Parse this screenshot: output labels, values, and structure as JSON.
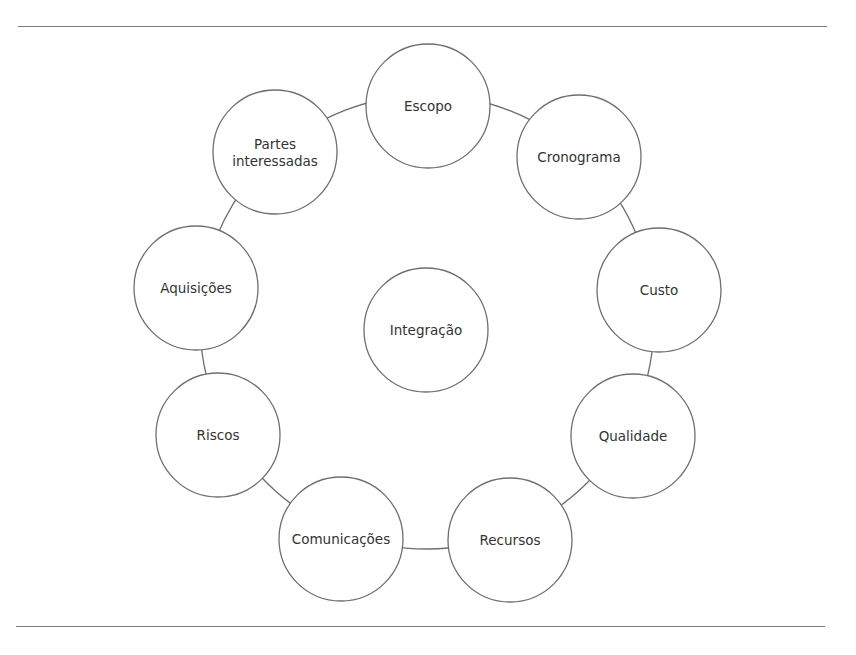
{
  "diagram": {
    "type": "ring-of-knowledge-areas",
    "colors": {
      "stroke": "#6e6e6e",
      "text": "#333333",
      "background": "#ffffff",
      "rule": "#7a7a7a"
    },
    "ring": {
      "cx": 427,
      "cy": 322,
      "r": 227
    },
    "center_node": {
      "label": "Integração",
      "cx": 426,
      "cy": 330,
      "r": 62
    },
    "outer_nodes": [
      {
        "id": "escopo",
        "label_lines": [
          "Escopo"
        ],
        "cx": 428,
        "cy": 106,
        "r": 62
      },
      {
        "id": "cronograma",
        "label_lines": [
          "Cronograma"
        ],
        "cx": 579,
        "cy": 157,
        "r": 62
      },
      {
        "id": "custo",
        "label_lines": [
          "Custo"
        ],
        "cx": 659,
        "cy": 290,
        "r": 62
      },
      {
        "id": "qualidade",
        "label_lines": [
          "Qualidade"
        ],
        "cx": 633,
        "cy": 436,
        "r": 62
      },
      {
        "id": "recursos",
        "label_lines": [
          "Recursos"
        ],
        "cx": 510,
        "cy": 540,
        "r": 62
      },
      {
        "id": "comunicacoes",
        "label_lines": [
          "Comunicações"
        ],
        "cx": 341,
        "cy": 539,
        "r": 62
      },
      {
        "id": "riscos",
        "label_lines": [
          "Riscos"
        ],
        "cx": 218,
        "cy": 435,
        "r": 62
      },
      {
        "id": "aquisicoes",
        "label_lines": [
          "Aquisições"
        ],
        "cx": 196,
        "cy": 288,
        "r": 62
      },
      {
        "id": "partes-interessadas",
        "label_lines": [
          "Partes",
          "interessadas"
        ],
        "cx": 275,
        "cy": 152,
        "r": 62
      }
    ]
  }
}
